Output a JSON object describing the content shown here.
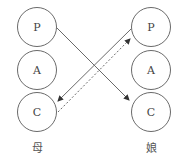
{
  "diagram": {
    "type": "transactional-analysis-crossed-transaction",
    "persons": [
      {
        "id": "mother",
        "label": "母",
        "ego_states": [
          "P",
          "A",
          "C"
        ]
      },
      {
        "id": "daughter",
        "label": "娘",
        "ego_states": [
          "P",
          "A",
          "C"
        ]
      }
    ],
    "transactions": [
      {
        "from": "mother.P",
        "to": "daughter.C",
        "style": "solid"
      },
      {
        "from": "daughter.P",
        "to": "mother.C",
        "style": "solid"
      },
      {
        "from": "mother.C",
        "to": "daughter.P",
        "style": "dotted"
      }
    ],
    "colors": {
      "stroke": "#6a6a6a",
      "text": "#444444"
    }
  }
}
